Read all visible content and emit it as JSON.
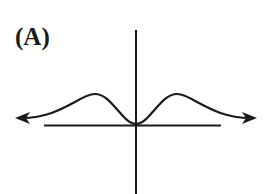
{
  "figure": {
    "label": "(A)",
    "colors": {
      "ink": "#1a1a1a",
      "background": "#ffffff"
    }
  }
}
